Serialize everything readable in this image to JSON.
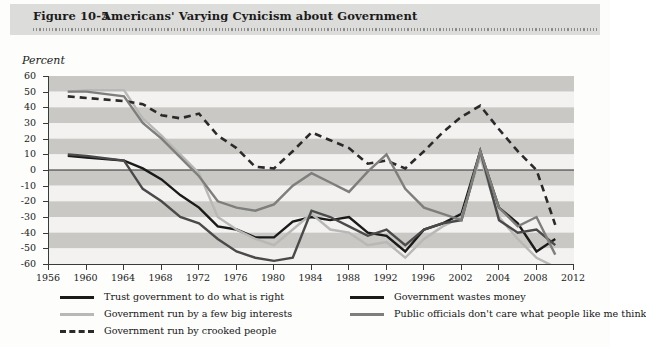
{
  "header": {
    "figure_number": "Figure 10-5",
    "title": "Americans' Varying Cynicism about Government"
  },
  "axis": {
    "ylabel": "Percent"
  },
  "chart_data": {
    "type": "line",
    "title": "Americans' Varying Cynicism about Government",
    "xlabel": "",
    "ylabel": "Percent",
    "xlim": [
      1956,
      2012
    ],
    "ylim": [
      -60,
      60
    ],
    "ytick_step": 10,
    "grid": "horizontal-bands",
    "legend_position": "below",
    "yticks": [
      60,
      50,
      40,
      30,
      20,
      10,
      0,
      -10,
      -20,
      -30,
      -40,
      -50,
      -60
    ],
    "xticks": [
      1956,
      1960,
      1964,
      1968,
      1972,
      1976,
      1980,
      1984,
      1988,
      1992,
      1996,
      2002,
      2004,
      2008,
      2012
    ],
    "x": [
      1958,
      1960,
      1964,
      1966,
      1968,
      1970,
      1972,
      1974,
      1976,
      1978,
      1980,
      1982,
      1984,
      1986,
      1988,
      1990,
      1992,
      1994,
      1996,
      1998,
      2000,
      2002,
      2004,
      2006,
      2008,
      2010
    ],
    "series": [
      {
        "name": "Trust government to do what is right",
        "color": "#1a1a1a",
        "style": "solid",
        "width": 2.4,
        "values": [
          9,
          8,
          6,
          1,
          -6,
          -16,
          -24,
          -36,
          -38,
          -43,
          -43,
          -33,
          -30,
          -32,
          -30,
          -40,
          -42,
          -52,
          -38,
          -34,
          -28,
          12,
          -24,
          -34,
          -52,
          -44
        ]
      },
      {
        "name": "Government run by a few big interests",
        "color": "#b8b8b6",
        "style": "solid",
        "width": 2.4,
        "values": [
          50,
          51,
          51,
          33,
          22,
          10,
          -2,
          -30,
          -38,
          -44,
          -48,
          -38,
          -28,
          -38,
          -40,
          -48,
          -46,
          -56,
          -44,
          -36,
          -30,
          8,
          -30,
          -44,
          -56,
          -62
        ]
      },
      {
        "name": "Government run by crooked people",
        "color": "#2a2a2a",
        "style": "dashed",
        "width": 2.6,
        "values": [
          47,
          46,
          44,
          42,
          35,
          33,
          36,
          22,
          14,
          2,
          1,
          12,
          24,
          19,
          14,
          4,
          6,
          1,
          12,
          24,
          34,
          41,
          26,
          12,
          0,
          -35
        ]
      },
      {
        "name": "Government wastes money",
        "color": "#4a4a4a",
        "style": "solid",
        "width": 2.4,
        "values": [
          10,
          9,
          6,
          -12,
          -20,
          -30,
          -34,
          -44,
          -52,
          -56,
          -58,
          -56,
          -26,
          -30,
          -36,
          -42,
          -38,
          -48,
          -38,
          -34,
          -32,
          12,
          -32,
          -40,
          -38,
          -48
        ]
      },
      {
        "name": "Public officials don't care what people like me think",
        "color": "#7e7e7c",
        "style": "solid",
        "width": 2.4,
        "values": [
          50,
          50,
          47,
          30,
          20,
          8,
          -4,
          -20,
          -24,
          -26,
          -22,
          -10,
          -2,
          -8,
          -14,
          -1,
          10,
          -12,
          -24,
          -28,
          -32,
          12,
          -24,
          -36,
          -30,
          -54
        ]
      }
    ]
  },
  "legend": {
    "items": [
      {
        "label": "Trust government to do what is right",
        "color": "#1a1a1a",
        "style": "solid",
        "col": 0,
        "row": 0
      },
      {
        "label": "Government run by a few big interests",
        "color": "#b8b8b6",
        "style": "solid",
        "col": 0,
        "row": 1
      },
      {
        "label": "Government run by crooked people",
        "color": "#2a2a2a",
        "style": "dashed",
        "col": 0,
        "row": 2
      },
      {
        "label": "Government wastes money",
        "color": "#1a1a1a",
        "style": "solid",
        "col": 1,
        "row": 0
      },
      {
        "label": "Public officials don't care what people like me think",
        "color": "#7e7e7c",
        "style": "solid",
        "col": 1,
        "row": 1
      }
    ]
  }
}
